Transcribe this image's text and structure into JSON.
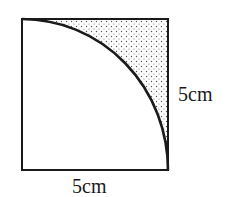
{
  "diagram": {
    "square": {
      "x": 22,
      "y": 19,
      "width": 146,
      "height": 151,
      "stroke": "#1a1a1a"
    },
    "arc": {
      "center": "bottom-left corner",
      "radius_label": "5cm",
      "from": "top-left corner",
      "to": "bottom-right corner"
    },
    "shaded_region": {
      "pattern": "dot-stipple",
      "dot_color": "#555555",
      "location": "top-right, between arc and square corner"
    },
    "labels": {
      "right_side": "5cm",
      "bottom_side": "5cm"
    }
  }
}
